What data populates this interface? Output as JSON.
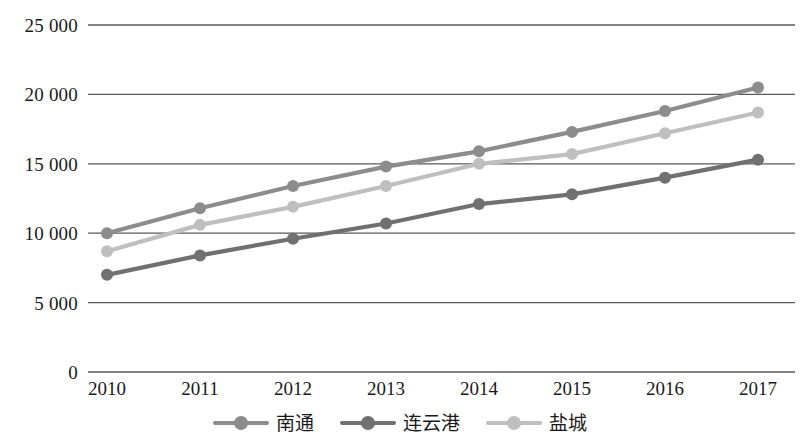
{
  "chart_data": {
    "type": "line",
    "title": "",
    "xlabel": "",
    "ylabel": "",
    "categories": [
      "2010",
      "2011",
      "2012",
      "2013",
      "2014",
      "2015",
      "2016",
      "2017"
    ],
    "ylim": [
      0,
      25000
    ],
    "y_ticks": [
      {
        "value": 25000,
        "label": "25 000"
      },
      {
        "value": 20000,
        "label": "20 000"
      },
      {
        "value": 15000,
        "label": "15 000"
      },
      {
        "value": 10000,
        "label": "10 000"
      },
      {
        "value": 5000,
        "label": "5 000"
      },
      {
        "value": 0,
        "label": "0"
      }
    ],
    "grid": true,
    "grid_axis": "y",
    "legend_position": "bottom",
    "markers": "circle",
    "series": [
      {
        "name": "南通",
        "color": "#8c8c8c",
        "values": [
          10000,
          11800,
          13400,
          14800,
          15900,
          17300,
          18800,
          20500
        ]
      },
      {
        "name": "连云港",
        "color": "#707070",
        "values": [
          7000,
          8400,
          9600,
          10700,
          12100,
          12800,
          14000,
          15300
        ]
      },
      {
        "name": "盐城",
        "color": "#bfbfbf",
        "values": [
          8700,
          10600,
          11900,
          13400,
          15000,
          15700,
          17200,
          18700
        ]
      }
    ]
  },
  "style": {
    "gridline_color": "#595959",
    "background": "#ffffff",
    "text_color": "#1a1a1a"
  }
}
